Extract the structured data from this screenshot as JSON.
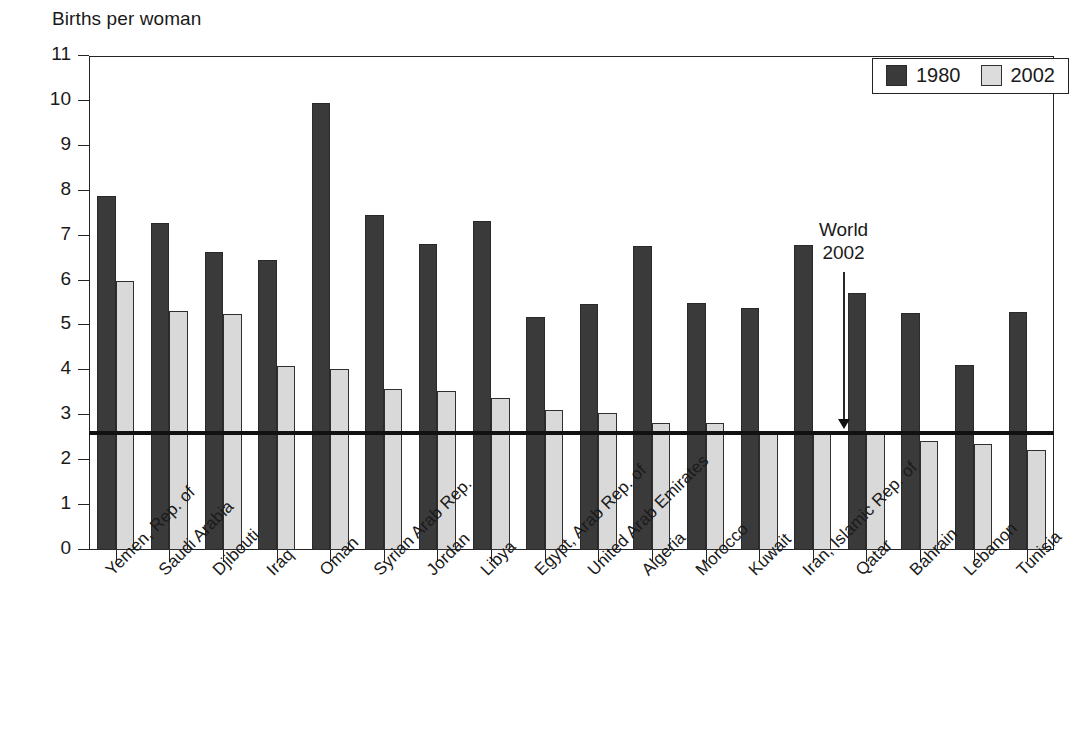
{
  "chart_data": {
    "type": "bar",
    "title": "",
    "ylabel": "Births per woman",
    "xlabel": "",
    "ylim": [
      0,
      11
    ],
    "ytick_step": 1,
    "grid": false,
    "legend_position": "top-right",
    "categories": [
      "Yemen, Rep. of",
      "Saudi Arabia",
      "Djibouti",
      "Iraq",
      "Oman",
      "Syrian Arab Rep.",
      "Jordan",
      "Libya",
      "Egypt, Arab Rep. of",
      "United Arab Emirates",
      "Algeria",
      "Morocco",
      "Kuwait",
      "Iran, Islamic Rep. of",
      "Qatar",
      "Bahrain",
      "Lebanon",
      "Tunisia"
    ],
    "series": [
      {
        "name": "1980",
        "color": "#3a3a3a",
        "values": [
          7.88,
          7.28,
          6.63,
          6.45,
          9.95,
          7.46,
          6.82,
          7.32,
          5.18,
          5.48,
          6.77,
          5.51,
          5.4,
          6.79,
          5.72,
          5.28,
          4.11,
          5.3
        ]
      },
      {
        "name": "2002",
        "color": "#d9d9d9",
        "values": [
          5.99,
          5.32,
          5.25,
          4.1,
          4.03,
          3.58,
          3.54,
          3.38,
          3.11,
          3.06,
          2.83,
          2.82,
          2.66,
          2.66,
          2.58,
          2.42,
          2.35,
          2.23
        ]
      }
    ],
    "yticks": [
      "0",
      "1",
      "2",
      "3",
      "4",
      "5",
      "6",
      "7",
      "8",
      "9",
      "10",
      "11"
    ],
    "reference_line": {
      "label_line1": "World",
      "label_line2": "2002",
      "value": 2.65,
      "color": "#111111"
    },
    "annotations": [
      {
        "text": "World 2002",
        "points_to": "reference-line"
      }
    ]
  },
  "legend": {
    "entries": [
      {
        "label": "1980",
        "swatch": "dark-gray-swatch"
      },
      {
        "label": "2002",
        "swatch": "light-gray-swatch"
      }
    ]
  }
}
